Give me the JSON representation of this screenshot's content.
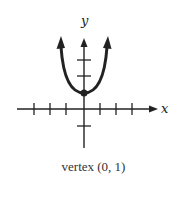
{
  "figure": {
    "x_axis_label": "x",
    "y_axis_label": "y",
    "caption": "vertex (0, 1)",
    "line_color": "#222222"
  },
  "graph": {
    "function": "y = a*x^2 + 1 (upward-opening parabola)",
    "vertex": {
      "x": 0,
      "y": 1
    },
    "x_ticks": [
      -3,
      -2,
      -1,
      1,
      2,
      3
    ],
    "y_ticks": [
      -1,
      2,
      3
    ],
    "x_range": [
      -4,
      4.5
    ],
    "y_range": [
      -2.5,
      4.5
    ],
    "arrows": [
      "left-branch-up",
      "right-branch-up",
      "y-axis-up",
      "x-axis-right"
    ]
  }
}
